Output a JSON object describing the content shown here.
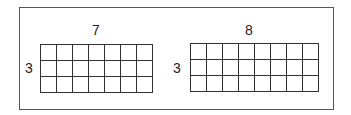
{
  "diagram": {
    "grids": [
      {
        "columns_label": "7",
        "rows_label": "3",
        "columns": 7,
        "rows": 3
      },
      {
        "columns_label": "8",
        "rows_label": "3",
        "columns": 8,
        "rows": 3
      }
    ]
  }
}
